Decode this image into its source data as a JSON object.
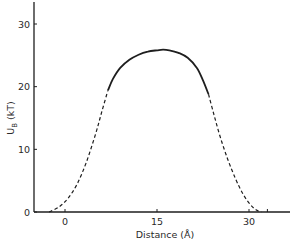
{
  "chart_data": {
    "type": "line",
    "title": "",
    "xlabel": "Distance (Å)",
    "ylabel": "U_B (kT)",
    "ylabel_main": "U",
    "ylabel_sub": "B",
    "ylabel_unit": "(kT)",
    "xlim": [
      -5,
      37
    ],
    "ylim": [
      0,
      33
    ],
    "x_ticks": [
      0,
      15,
      30
    ],
    "x_tick_labels": [
      "0",
      "15",
      "30"
    ],
    "x_minor_ticks": [
      33
    ],
    "y_ticks": [
      0,
      10,
      20,
      30
    ],
    "y_tick_labels": [
      "0",
      "10",
      "20",
      "30"
    ],
    "grid": false,
    "legend": null,
    "series": [
      {
        "name": "left extrapolation (dashed)",
        "style": "dashed",
        "x": [
          -2.6,
          -1,
          0.5,
          2,
          3.5,
          5,
          6,
          7
        ],
        "y": [
          0,
          0.8,
          2.2,
          4.5,
          8.0,
          12.5,
          16.0,
          19.4
        ]
      },
      {
        "name": "computed barrier (solid)",
        "style": "solid",
        "x": [
          7,
          7.8,
          9,
          10.5,
          12,
          13.5,
          15,
          16,
          17,
          18.5,
          20,
          21.5,
          22.5,
          23.4
        ],
        "y": [
          19.4,
          21.2,
          23.0,
          24.3,
          25.1,
          25.6,
          25.8,
          25.9,
          25.8,
          25.4,
          24.6,
          23.0,
          21.0,
          18.8
        ]
      },
      {
        "name": "right extrapolation (dashed)",
        "style": "dashed",
        "x": [
          23.4,
          24.3,
          25.3,
          26.5,
          27.8,
          29,
          30.2,
          31.2,
          32
        ],
        "y": [
          18.8,
          15.5,
          12.0,
          8.5,
          5.3,
          2.9,
          1.2,
          0.3,
          0
        ]
      }
    ],
    "peak": {
      "x": 15.8,
      "y": 25.9
    }
  }
}
